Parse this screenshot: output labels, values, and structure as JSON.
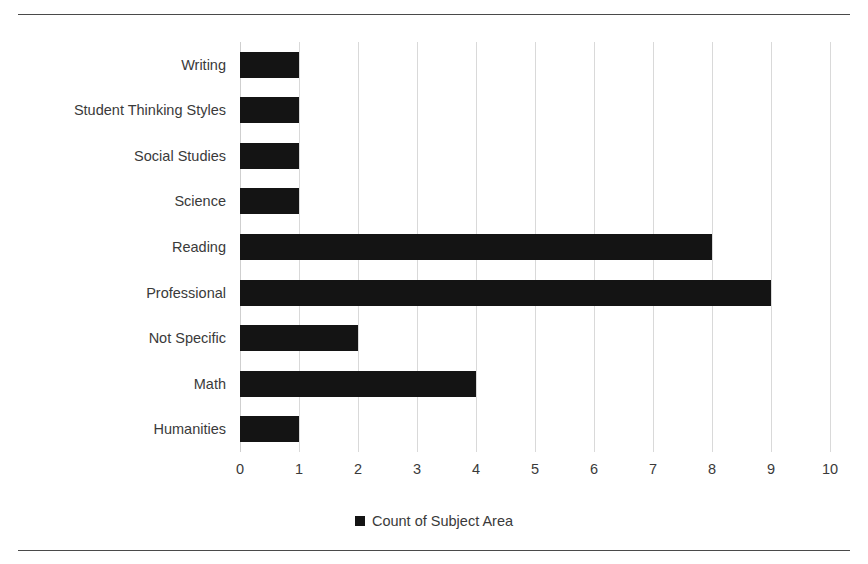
{
  "chart_data": {
    "type": "bar",
    "orientation": "horizontal",
    "title": "",
    "xlabel": "",
    "ylabel": "",
    "categories": [
      "Writing",
      "Student Thinking Styles",
      "Social Studies",
      "Science",
      "Reading",
      "Professional",
      "Not Specific",
      "Math",
      "Humanities"
    ],
    "values": [
      1,
      1,
      1,
      1,
      8,
      9,
      2,
      4,
      1
    ],
    "series": [
      {
        "name": "Count of Subject Area",
        "values": [
          1,
          1,
          1,
          1,
          8,
          9,
          2,
          4,
          1
        ]
      }
    ],
    "xlim": [
      0,
      10
    ],
    "xticks": [
      0,
      1,
      2,
      3,
      4,
      5,
      6,
      7,
      8,
      9,
      10
    ],
    "xtick_labels": [
      "0",
      "1",
      "2",
      "3",
      "4",
      "5",
      "6",
      "7",
      "8",
      "9",
      "10"
    ],
    "grid": "vertical",
    "legend": {
      "position": "bottom-center",
      "entries": [
        {
          "label": "Count of Subject Area",
          "color": "#141414"
        }
      ]
    },
    "bar_color": "#141414",
    "gridline_color": "#d9d9d9",
    "text_color": "#3a3a3a"
  },
  "frame": {
    "rule_color": "#4a4a4a",
    "title_cropped": ""
  }
}
